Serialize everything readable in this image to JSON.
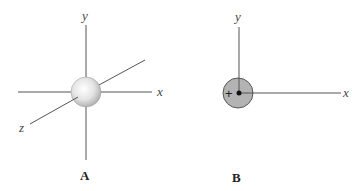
{
  "panels": [
    {
      "id": "A",
      "label": "A",
      "type": "3d-axes-sphere",
      "axis_labels": {
        "x": "x",
        "y": "y",
        "z": "z"
      },
      "center": [
        86,
        92
      ],
      "object": {
        "shape": "sphere",
        "radius": 15,
        "fill": "#e0e0e0"
      }
    },
    {
      "id": "B",
      "label": "B",
      "type": "2d-axes-circle",
      "axis_labels": {
        "x": "x",
        "y": "y"
      },
      "center": [
        239,
        93
      ],
      "object": {
        "shape": "circle",
        "radius": 15,
        "fill": "#b3b3b3",
        "sign": "+",
        "center_dot": true
      }
    }
  ],
  "colors": {
    "axis": "#555555",
    "circle_fill": "#b3b3b3",
    "circle_stroke": "#555555",
    "sphere_highlight": "#ffffff",
    "sphere_shadow": "#a8a8a8"
  }
}
